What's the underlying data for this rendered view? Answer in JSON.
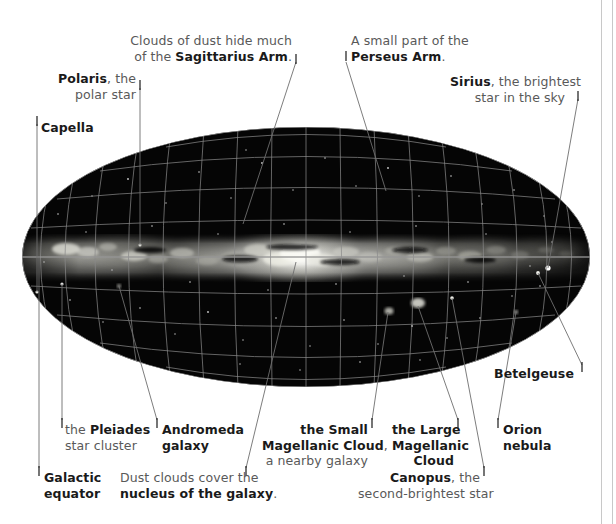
{
  "figure": {
    "type": "annotated-sky-map",
    "projection": "elliptical all-sky (Aitoff/Mollweide) panorama of the Milky Way"
  },
  "annotations": [
    {
      "id": "polaris",
      "name": "polaris",
      "align": "right",
      "lines": [
        [
          {
            "t": "Polaris",
            "b": true
          },
          {
            "t": ", the",
            "b": false
          }
        ],
        [
          {
            "t": "polar star",
            "b": false
          }
        ]
      ],
      "label_x": 38,
      "label_y": 71,
      "label_w": 98,
      "tick_x": 140,
      "tick_y": 84,
      "leader": [
        [
          140,
          88
        ],
        [
          140,
          245
        ]
      ]
    },
    {
      "id": "capella",
      "name": "capella",
      "align": "left",
      "lines": [
        [
          {
            "t": "Capella",
            "b": true
          }
        ]
      ],
      "label_x": 41,
      "label_y": 120,
      "label_w": 70,
      "tick_x": 37,
      "tick_y": 120,
      "leader": [
        [
          37,
          124
        ],
        [
          37,
          292
        ]
      ]
    },
    {
      "id": "sagittarius-arm",
      "name": "sagittarius-arm",
      "align": "right",
      "lines": [
        [
          {
            "t": "Clouds of dust hide much",
            "b": false
          }
        ],
        [
          {
            "t": "of the ",
            "b": false
          },
          {
            "t": "Sagittarius Arm",
            "b": true
          },
          {
            "t": ".",
            "b": false
          }
        ]
      ],
      "label_x": 130,
      "label_y": 33,
      "label_w": 162,
      "tick_x": 296,
      "tick_y": 58,
      "leader": [
        [
          296,
          62
        ],
        [
          243,
          224
        ]
      ]
    },
    {
      "id": "perseus-arm",
      "name": "perseus-arm",
      "align": "left",
      "lines": [
        [
          {
            "t": "A small part of the",
            "b": false
          }
        ],
        [
          {
            "t": "Perseus Arm",
            "b": true
          },
          {
            "t": ".",
            "b": false
          }
        ]
      ],
      "label_x": 351,
      "label_y": 33,
      "label_w": 120,
      "tick_x": 346,
      "tick_y": 55,
      "leader": [
        [
          346,
          62
        ],
        [
          386,
          191
        ]
      ]
    },
    {
      "id": "sirius",
      "name": "sirius",
      "align": "right",
      "lines": [
        [
          {
            "t": "Sirius",
            "b": true
          },
          {
            "t": ", the brightest",
            "b": false
          }
        ],
        [
          {
            "t": "star in the sky",
            "b": false
          }
        ]
      ],
      "label_x": 450,
      "label_y": 74,
      "label_w": 115,
      "tick_x": 578,
      "tick_y": 95,
      "leader": [
        [
          578,
          99
        ],
        [
          548,
          268
        ]
      ]
    },
    {
      "id": "betelgeuse",
      "name": "betelgeuse",
      "align": "right",
      "lines": [
        [
          {
            "t": "Betelgeuse",
            "b": true
          }
        ]
      ],
      "label_x": 486,
      "label_y": 366,
      "label_w": 88,
      "tick_x": 582,
      "tick_y": 366,
      "leader": [
        [
          582,
          365
        ],
        [
          538,
          273
        ]
      ]
    },
    {
      "id": "pleiades",
      "name": "pleiades-star-cluster",
      "align": "left",
      "lines": [
        [
          {
            "t": "the ",
            "b": false
          },
          {
            "t": "Pleiades",
            "b": true
          }
        ],
        [
          {
            "t": "star cluster",
            "b": false
          }
        ]
      ],
      "label_x": 65,
      "label_y": 422,
      "label_w": 86,
      "tick_x": 62,
      "tick_y": 422,
      "leader": [
        [
          62,
          420
        ],
        [
          62,
          284
        ]
      ]
    },
    {
      "id": "andromeda",
      "name": "andromeda-galaxy",
      "align": "left",
      "lines": [
        [
          {
            "t": "Andromeda",
            "b": true
          }
        ],
        [
          {
            "t": "galaxy",
            "b": true
          }
        ]
      ],
      "label_x": 162,
      "label_y": 422,
      "label_w": 82,
      "tick_x": 157,
      "tick_y": 422,
      "leader": [
        [
          157,
          420
        ],
        [
          119,
          286
        ]
      ]
    },
    {
      "id": "galactic-equator",
      "name": "galactic-equator",
      "align": "left",
      "lines": [
        [
          {
            "t": "Galactic",
            "b": true
          }
        ],
        [
          {
            "t": "equator",
            "b": true
          }
        ]
      ],
      "label_x": 44,
      "label_y": 470,
      "label_w": 68,
      "tick_x": 39,
      "tick_y": 470,
      "leader": [
        [
          39,
          468
        ],
        [
          39,
          256
        ]
      ]
    },
    {
      "id": "nucleus",
      "name": "nucleus-of-the-galaxy",
      "align": "right",
      "lines": [
        [
          {
            "t": "Dust clouds cover the",
            "b": false
          }
        ],
        [
          {
            "t": "nucleus of the galaxy",
            "b": true
          },
          {
            "t": ".",
            "b": false
          }
        ]
      ],
      "label_x": 120,
      "label_y": 470,
      "label_w": 122,
      "tick_x": 246,
      "tick_y": 470,
      "leader": [
        [
          246,
          468
        ],
        [
          296,
          262
        ]
      ]
    },
    {
      "id": "smc",
      "name": "small-magellanic-cloud",
      "align": "right",
      "lines": [
        [
          {
            "t": "the Small",
            "b": true
          }
        ],
        [
          {
            "t": "Magellanic Cloud",
            "b": true
          },
          {
            "t": ",",
            "b": false
          }
        ],
        [
          {
            "t": "a nearby galaxy",
            "b": false
          }
        ]
      ],
      "label_x": 262,
      "label_y": 422,
      "label_w": 106,
      "tick_x": 372,
      "tick_y": 422,
      "leader": [
        [
          372,
          420
        ],
        [
          388,
          312
        ]
      ]
    },
    {
      "id": "lmc",
      "name": "large-magellanic-cloud",
      "align": "right",
      "lines": [
        [
          {
            "t": "the Large",
            "b": true
          }
        ],
        [
          {
            "t": "Magellanic",
            "b": true
          }
        ],
        [
          {
            "t": "Cloud",
            "b": true
          }
        ]
      ],
      "label_x": 392,
      "label_y": 422,
      "label_w": 62,
      "tick_x": 458,
      "tick_y": 422,
      "leader": [
        [
          458,
          420
        ],
        [
          418,
          306
        ]
      ]
    },
    {
      "id": "canopus",
      "name": "canopus",
      "align": "right",
      "lines": [
        [
          {
            "t": "Canopus",
            "b": true
          },
          {
            "t": ", the",
            "b": false
          }
        ],
        [
          {
            "t": "second-brightest star",
            "b": false
          }
        ]
      ],
      "label_x": 358,
      "label_y": 470,
      "label_w": 122,
      "tick_x": 484,
      "tick_y": 470,
      "leader": [
        [
          484,
          468
        ],
        [
          452,
          298
        ]
      ]
    },
    {
      "id": "orion-nebula",
      "name": "orion-nebula",
      "align": "left",
      "lines": [
        [
          {
            "t": "Orion",
            "b": true
          }
        ],
        [
          {
            "t": "nebula",
            "b": true
          }
        ]
      ],
      "label_x": 503,
      "label_y": 422,
      "label_w": 52,
      "tick_x": 498,
      "tick_y": 422,
      "leader": [
        [
          498,
          420
        ],
        [
          516,
          312
        ]
      ]
    }
  ],
  "map": {
    "ellipse": {
      "cx": 306,
      "cy": 257,
      "rx": 284,
      "ry": 130
    },
    "grid_color": "#8a8a8a",
    "sky_color": "#050505",
    "milky_way_color": "#e8e8e8",
    "meridian_count": 17,
    "parallel_count": 9
  },
  "colors": {
    "label_bold": "#1a1a1a",
    "label_plain": "#595959",
    "leader": "#6e6e6e",
    "frame_rule": "#c8c8c8"
  },
  "frame": {
    "right_rule_x": 601,
    "right_rule_inner_x": 612
  }
}
